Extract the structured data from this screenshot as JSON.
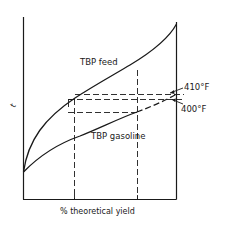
{
  "diagram": {
    "y_axis_label": "t",
    "x_axis_label": "% theoretical yield",
    "curves": [
      {
        "name": "TBP feed",
        "label": "TBP feed"
      },
      {
        "name": "TBP gasoline",
        "label": "TBP gasoline"
      }
    ],
    "annotations": {
      "upper_temp": "410°F",
      "lower_temp": "400°F"
    },
    "colors": {
      "line": "#1a1a1a",
      "background": "#ffffff"
    }
  }
}
